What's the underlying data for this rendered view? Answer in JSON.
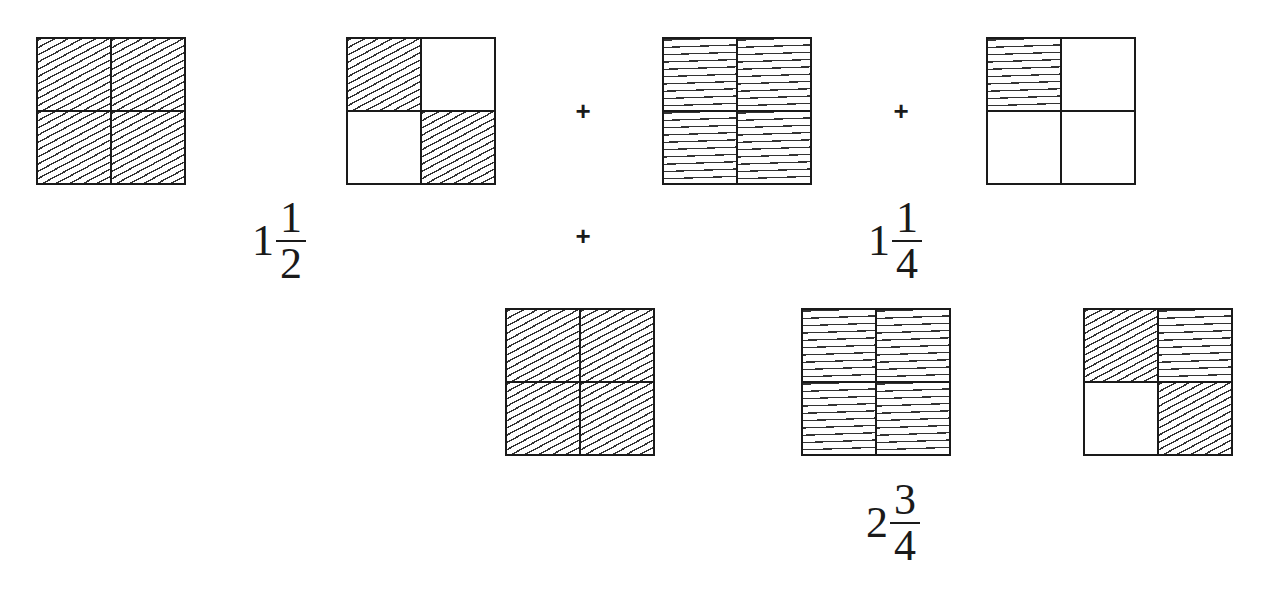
{
  "diagram": {
    "hatch_styles": {
      "diag": "diagonal hatching",
      "horiz": "horizontal hatching",
      "empty": "unshaded"
    },
    "squares": [
      {
        "id": "sq1",
        "x": 36,
        "y": 37,
        "cells": [
          "diag",
          "diag",
          "diag",
          "diag"
        ],
        "shaded_quarters": 4
      },
      {
        "id": "sq2",
        "x": 346,
        "y": 37,
        "cells": [
          "diag",
          "empty",
          "empty",
          "diag"
        ],
        "shaded_quarters": 2
      },
      {
        "id": "sq3",
        "x": 662,
        "y": 37,
        "cells": [
          "horiz",
          "horiz",
          "horiz",
          "horiz"
        ],
        "shaded_quarters": 4
      },
      {
        "id": "sq4",
        "x": 986,
        "y": 37,
        "cells": [
          "horiz",
          "empty",
          "empty",
          "empty"
        ],
        "shaded_quarters": 1
      },
      {
        "id": "sq5",
        "x": 505,
        "y": 308,
        "cells": [
          "diag",
          "diag",
          "diag",
          "diag"
        ],
        "shaded_quarters": 4
      },
      {
        "id": "sq6",
        "x": 801,
        "y": 308,
        "cells": [
          "horiz",
          "horiz",
          "horiz",
          "horiz"
        ],
        "shaded_quarters": 4
      },
      {
        "id": "sq7",
        "x": 1083,
        "y": 308,
        "cells": [
          "diag",
          "horiz",
          "empty",
          "diag"
        ],
        "shaded_quarters": 3
      }
    ],
    "operators": [
      {
        "symbol": "+",
        "x": 570,
        "y": 98
      },
      {
        "symbol": "+",
        "x": 888,
        "y": 98
      },
      {
        "symbol": "+",
        "x": 570,
        "y": 223
      }
    ],
    "labels": [
      {
        "id": "label-first-addend",
        "whole": "1",
        "numerator": "1",
        "denominator": "2",
        "x": 252,
        "y": 198
      },
      {
        "id": "label-second-addend",
        "whole": "1",
        "numerator": "1",
        "denominator": "4",
        "x": 868,
        "y": 198
      },
      {
        "id": "label-sum",
        "whole": "2",
        "numerator": "3",
        "denominator": "4",
        "x": 866,
        "y": 480
      }
    ]
  }
}
